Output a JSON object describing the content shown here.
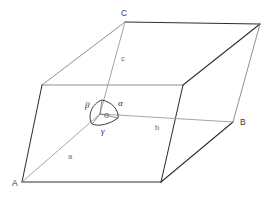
{
  "figure": {
    "name": "crystal-unit-cell-parallelepiped",
    "background_color": "#ffffff"
  },
  "colors": {
    "edge_dark": "#2e2e2e",
    "edge_light": "#8a8a8a",
    "vector_line": "#9b9b9b",
    "arc_stroke": "#3a3a3a",
    "vertex_text": "#3c3c3c",
    "axis_text": "#6e6e6e",
    "angle_text": "#2f2f2f"
  },
  "vertex_labels": [
    {
      "id": "vertex-A",
      "text": "A",
      "x": 12,
      "y": 186
    },
    {
      "id": "vertex-B",
      "text": "B",
      "x": 240,
      "y": 125
    },
    {
      "id": "vertex-C",
      "text": "C",
      "x": 121,
      "y": 16
    }
  ],
  "axis_labels": [
    {
      "id": "axis-a",
      "text": "a",
      "x": 68,
      "y": 159
    },
    {
      "id": "axis-b",
      "text": "b",
      "x": 155,
      "y": 130
    },
    {
      "id": "axis-c",
      "text": "c",
      "x": 121,
      "y": 61
    }
  ],
  "angle_labels": [
    {
      "id": "angle-alpha",
      "text": "α",
      "x": 118,
      "y": 106
    },
    {
      "id": "angle-beta",
      "text": "β",
      "x": 88,
      "y": 107
    },
    {
      "id": "angle-gamma",
      "text": "γ",
      "x": 103,
      "y": 131
    }
  ],
  "origin": {
    "id": "origin-O",
    "text": "O",
    "x": 105,
    "y": 119
  },
  "geometry": {
    "origin_point": [
      100,
      114
    ],
    "vertex_A_point": [
      22,
      182
    ],
    "vertex_B_point": [
      233,
      122
    ],
    "vertex_C_point": [
      125,
      22
    ],
    "front_top_left": [
      42,
      85
    ],
    "front_top_right": [
      183,
      85
    ],
    "front_bottom_right": [
      161,
      182
    ],
    "back_top_right": [
      260,
      24
    ],
    "top_face_path": "M42,85 L125,22 L260,24 L183,85 Z",
    "front_face_path": "M42,85 L183,85 L161,182 L22,182 Z",
    "right_face_path": "M183,85 L260,24 L233,122 L161,182 Z",
    "hidden_left_edge": "M42,85 L22,182",
    "vector_a_path": "M100,114 L22,182",
    "vector_b_path": "M100,114 L233,122",
    "vector_c_path": "M100,114 L125,22",
    "angle_arc_path": "M100,99 C111,100 119,109 118,117 C112,124 101,128 93,125 C87,118 90,104 100,99 Z"
  }
}
